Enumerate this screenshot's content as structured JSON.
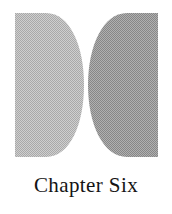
{
  "page": {
    "background_color": "#ffffff",
    "width": 172,
    "height": 214
  },
  "figure": {
    "name": "two-half-discs-figure",
    "texture": "dithered-halftone",
    "shapes": [
      {
        "name": "left-half-disc",
        "orientation": "flat-edge-left",
        "fill_color": "#bdbdbd",
        "edge_color": "#b0b0b0"
      },
      {
        "name": "right-half-disc",
        "orientation": "flat-edge-right",
        "fill_color": "#9d9d9d",
        "edge_color": "#919191"
      }
    ]
  },
  "caption": {
    "text": "Chapter Six",
    "color": "#141414"
  }
}
